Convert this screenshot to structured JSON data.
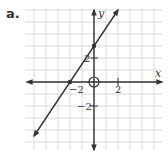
{
  "figure": {
    "label": "a."
  },
  "chart_data": {
    "type": "line",
    "title": "",
    "xlabel": "x",
    "ylabel": "y",
    "xlim": [
      -6,
      6
    ],
    "ylim": [
      -6,
      6
    ],
    "grid": true,
    "x_tick_labels": [
      {
        "value": -2,
        "text": "−2"
      },
      {
        "value": 2,
        "text": "2"
      }
    ],
    "y_tick_labels": [
      {
        "value": 2,
        "text": "2"
      },
      {
        "value": -2,
        "text": "−2"
      }
    ],
    "series": [
      {
        "name": "line",
        "equation": "y = 1.5x + 3",
        "points": [
          {
            "x": -2,
            "y": 0
          },
          {
            "x": 0,
            "y": 3
          }
        ],
        "endpoints": [
          {
            "x": -5,
            "y": -4.5
          },
          {
            "x": 2,
            "y": 6
          }
        ],
        "arrows": "both"
      }
    ],
    "annotations": [
      {
        "type": "open-circle",
        "x": 0,
        "y": 0
      }
    ]
  },
  "colors": {
    "grid": "#d9d9d9",
    "axis": "#333333",
    "line": "#333333"
  }
}
